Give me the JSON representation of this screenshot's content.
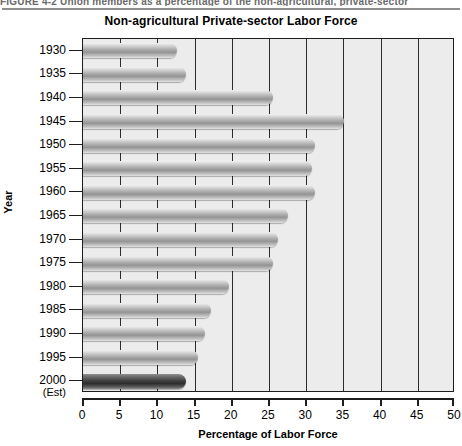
{
  "figure": {
    "caption": "FIGURE 4-2  Union members as a percentage of the non-agricultural, private-sector"
  },
  "chart_data": {
    "type": "bar",
    "orientation": "horizontal",
    "title": "Non-agricultural Private-sector Labor Force",
    "xlabel": "Percentage of Labor Force",
    "ylabel": "Year",
    "xlim": [
      0,
      50
    ],
    "xticks": [
      0,
      5,
      10,
      15,
      20,
      25,
      30,
      35,
      40,
      45,
      50
    ],
    "xtick_labels": [
      "0",
      "5",
      "10",
      "15",
      "20",
      "25",
      "30",
      "35",
      "40",
      "45",
      "50"
    ],
    "grid": "vertical",
    "legend": "none",
    "categories": [
      "1930",
      "1935",
      "1940",
      "1945",
      "1950",
      "1955",
      "1960",
      "1965",
      "1970",
      "1975",
      "1980",
      "1985",
      "1990",
      "1995",
      "2000"
    ],
    "category_sublabels": [
      "",
      "",
      "",
      "",
      "",
      "",
      "",
      "",
      "",
      "",
      "",
      "",
      "",
      "",
      "(Est)"
    ],
    "values": [
      12.6,
      13.8,
      25.5,
      35.1,
      31.2,
      30.8,
      31.2,
      27.5,
      26.2,
      25.5,
      19.6,
      17.2,
      16.4,
      15.5,
      13.8
    ],
    "highlight_index": 14,
    "colors": {
      "bar": "#a9a9a9",
      "bar_highlight": "#3c3c3c",
      "plot_background": "#ececec",
      "axis": "#1d1d1d",
      "gridline": "#2b2b2b",
      "caption": "#6a6a6a"
    }
  }
}
